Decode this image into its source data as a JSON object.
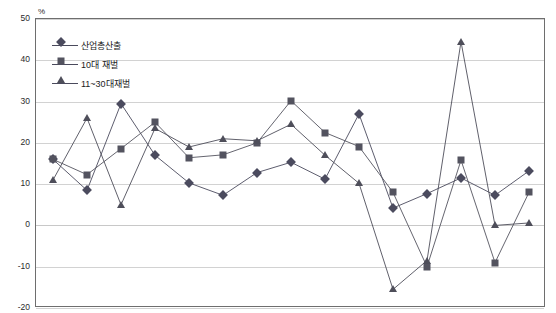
{
  "chart_data": {
    "type": "line",
    "title": "",
    "subtitle": "",
    "xlabel": "",
    "ylabel": "",
    "unit_label": "%",
    "grid": true,
    "legend_position": "top-left",
    "xlim": [
      1988,
      2002
    ],
    "ylim": [
      -20,
      50
    ],
    "ytick_step": 10,
    "yticks": [
      50,
      40,
      30,
      20,
      10,
      0,
      -10,
      -20
    ],
    "ytick_labels": [
      "50",
      "40",
      "30",
      "20",
      "10",
      "0",
      "-10",
      "-20"
    ],
    "categories": [
      1988,
      1989,
      1990,
      1991,
      1992,
      1993,
      1994,
      1995,
      1996,
      1997,
      1998,
      1999,
      2000,
      2001,
      2002
    ],
    "xtick_labels": [
      "1988",
      "1989",
      "1990",
      "1991",
      "1992",
      "1993",
      "1994",
      "1995",
      "1996",
      "1997",
      "1998",
      "1999",
      "2000",
      "2001",
      "2002"
    ],
    "series": [
      {
        "name": "산업총산출",
        "marker": "diamond",
        "color": "#4b4b5e",
        "values": [
          16.0,
          8.5,
          29.5,
          17.0,
          10.3,
          7.3,
          12.8,
          15.3,
          11.2,
          27.0,
          4.2,
          7.7,
          11.5,
          7.3,
          13.2
        ]
      },
      {
        "name": "10대 재벌",
        "marker": "square",
        "color": "#53535f",
        "values": [
          16.0,
          12.3,
          18.6,
          25.0,
          16.4,
          17.1,
          20.0,
          30.2,
          22.5,
          19.1,
          8.0,
          -10.0,
          15.8,
          -9.0,
          8.0
        ]
      },
      {
        "name": "11~30대 재벌",
        "marker": "triangle",
        "color": "#4e4e5a",
        "values": [
          11.0,
          26.0,
          5.0,
          23.5,
          19.0,
          21.0,
          20.5,
          24.5,
          17.0,
          10.2,
          -15.5,
          -8.5,
          44.5,
          0.0,
          0.6
        ]
      }
    ]
  },
  "legend": {
    "items": [
      {
        "label": "산업총산출",
        "marker": "diamond"
      },
      {
        "label": "10대 재벌",
        "marker": "square"
      },
      {
        "label": "11~30대재벌",
        "marker": "triangle"
      }
    ]
  },
  "axes": {
    "unit": "%"
  }
}
